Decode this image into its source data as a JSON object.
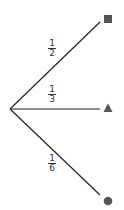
{
  "diagram": {
    "type": "probability-tree",
    "colors": {
      "line": "#222222",
      "marker": "#555555",
      "text": "#333333"
    },
    "root": {
      "x": 10,
      "y": 109
    },
    "branches": [
      {
        "label": {
          "numerator": "1",
          "denominator": "2"
        },
        "end": {
          "x": 100,
          "y": 22
        },
        "marker": {
          "shape": "square",
          "icon": "square-icon",
          "cx": 108,
          "cy": 19
        }
      },
      {
        "label": {
          "numerator": "1",
          "denominator": "3"
        },
        "end": {
          "x": 100,
          "y": 109
        },
        "marker": {
          "shape": "triangle",
          "icon": "triangle-icon",
          "cx": 108,
          "cy": 108
        }
      },
      {
        "label": {
          "numerator": "1",
          "denominator": "6"
        },
        "end": {
          "x": 100,
          "y": 195
        },
        "marker": {
          "shape": "circle",
          "icon": "circle-icon",
          "cx": 108,
          "cy": 201
        }
      }
    ]
  }
}
